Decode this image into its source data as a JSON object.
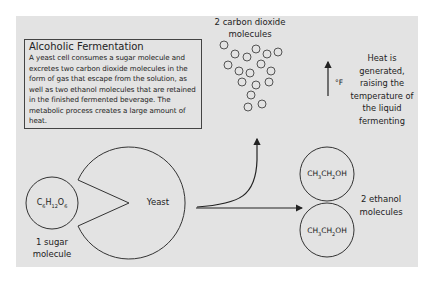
{
  "diagram": {
    "textbox": {
      "title": "Alcoholic Fermentation",
      "body": "A yeast cell consumes a sugar molecule and excretes two carbon dioxide molecules in the form of gas that escape from the solution, as well as two ethanol molecules that are retained in the finished fermented beverage. The metabolic process creates a large amount of heat."
    },
    "sugar": {
      "formula_parts": [
        "C",
        "6",
        "H",
        "12",
        "O",
        "6"
      ],
      "label_line1": "1 sugar",
      "label_line2": "molecule"
    },
    "yeast": {
      "label": "Yeast"
    },
    "co2": {
      "label_line1": "2 carbon dioxide",
      "label_line2": "molecules"
    },
    "heat": {
      "unit": "°F",
      "lines": [
        "Heat is",
        "generated,",
        "raising the",
        "temperature of",
        "the liquid",
        "fermenting"
      ]
    },
    "ethanol": {
      "formula_parts": [
        "CH",
        "3",
        "CH",
        "2",
        "OH"
      ],
      "label_line1": "2 ethanol",
      "label_line2": "molecules"
    },
    "colors": {
      "panel": "#e3e3e3",
      "stroke": "#333333",
      "text": "#222222"
    }
  }
}
